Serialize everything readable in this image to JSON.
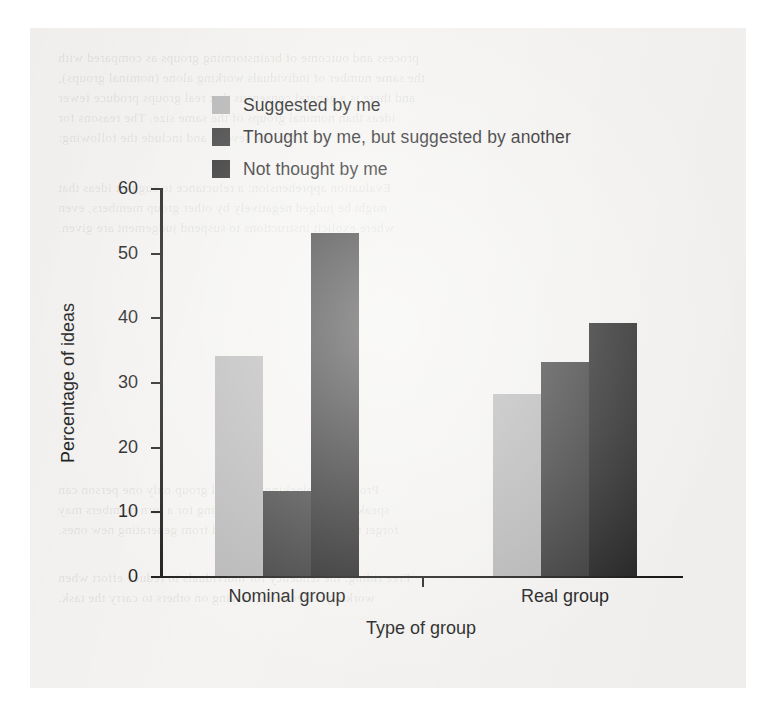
{
  "chart_data": {
    "type": "bar",
    "title": "",
    "subtitle": "",
    "xlabel": "Type of group",
    "ylabel": "Percentage of ideas",
    "categories": [
      "Nominal group",
      "Real group"
    ],
    "series": [
      {
        "name": "Suggested by me",
        "color": "#b5b5b5",
        "values": [
          34,
          28
        ]
      },
      {
        "name": "Thought by me, but suggested by another",
        "color": "#3a3a3a",
        "values": [
          13,
          33
        ]
      },
      {
        "name": "Not thought by me",
        "color": "#262626",
        "values": [
          53,
          39
        ]
      }
    ],
    "ylim": [
      0,
      60
    ],
    "yticks": [
      0,
      10,
      20,
      30,
      40,
      50,
      60
    ],
    "ytick_labels": [
      "0",
      "10",
      "20",
      "30",
      "40",
      "50",
      "60"
    ],
    "grid": false,
    "legend_position": "top-left-inside",
    "annotations": []
  },
  "legend": {
    "items": [
      {
        "label": "Suggested by me",
        "color": "#b5b5b5"
      },
      {
        "label": "Thought by me, but suggested by another",
        "color": "#3a3a3a"
      },
      {
        "label": "Not thought by me",
        "color": "#262626"
      }
    ]
  },
  "axes": {
    "y_title": "Percentage of ideas",
    "x_title": "Type of group",
    "y_ticks": [
      "60",
      "50",
      "40",
      "30",
      "20",
      "10",
      "0"
    ],
    "x_categories": [
      "Nominal group",
      "Real group"
    ]
  },
  "page": {
    "background_color": "#f4f3f1",
    "ink_color": "#1d1d1d"
  },
  "bleed_text": {
    "lines": [
      "process and outcome of brainstorming groups as compared with",
      "the same number of individuals working alone (nominal groups),",
      "and there is a general consensus that real groups produce fewer",
      "ideas than nominal groups of the same size. The reasons for",
      "this are several and include the following:",
      "",
      "Evaluation apprehension: a reluctance to suggest ideas that",
      "might be judged negatively by other group members, even",
      "where explicit instructions to suspend judgement are given.",
      "",
      "Production blocking: in a real group only one person can",
      "speak at a time, and while waiting for a turn members may",
      "forget their ideas or be distracted from generating new ones.",
      "",
      "Free riding: the tendency for individuals to reduce effort when",
      "working collectively, relying on others to carry the task."
    ]
  }
}
